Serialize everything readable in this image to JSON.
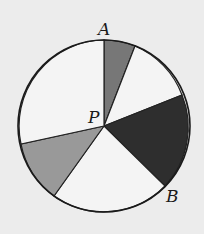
{
  "diagram": {
    "type": "circle-spinner",
    "center": {
      "label": "P",
      "x": 104,
      "y": 126
    },
    "radius": 86,
    "points": [
      {
        "label": "A",
        "x": 104,
        "y": 40
      },
      {
        "label": "B",
        "x": 165,
        "y": 186
      }
    ],
    "sectors": [
      {
        "from": [
          104,
          40
        ],
        "to": [
          135,
          48
        ],
        "fill": "#777777"
      },
      {
        "from": [
          135,
          48
        ],
        "to": [
          182,
          94
        ],
        "fill": "#f4f4f4"
      },
      {
        "from": [
          182,
          94
        ],
        "to": [
          165,
          186
        ],
        "fill": "#2e2e2e"
      },
      {
        "from": [
          165,
          186
        ],
        "to": [
          54,
          195
        ],
        "fill": "#f4f4f4"
      },
      {
        "from": [
          54,
          195
        ],
        "to": [
          21,
          144
        ],
        "fill": "#999999"
      },
      {
        "from": [
          21,
          144
        ],
        "to": [
          104,
          40
        ],
        "fill": "#f4f4f4"
      }
    ],
    "labels": {
      "A": "A",
      "B": "B",
      "P": "P"
    }
  }
}
